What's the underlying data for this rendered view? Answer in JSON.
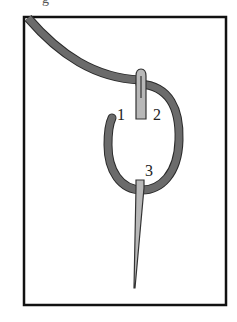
{
  "figure": {
    "top_fragment": "g",
    "labels": [
      {
        "id": "1",
        "text": "1"
      },
      {
        "id": "2",
        "text": "2"
      },
      {
        "id": "3",
        "text": "3"
      }
    ],
    "colors": {
      "frame": "#111111",
      "thread": "#6b6b6b",
      "thread_outline": "#2a2a2a",
      "needle": "#b8b8b8",
      "needle_outline": "#333333",
      "background": "#ffffff"
    }
  }
}
